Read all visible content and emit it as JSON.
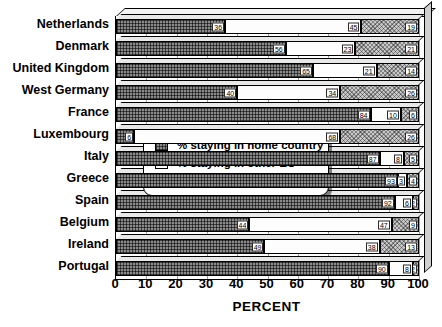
{
  "chart_data": {
    "type": "bar",
    "subtype": "stacked-horizontal-100-percent",
    "title": "",
    "xlabel": "PERCENT",
    "ylabel": "",
    "xlim": [
      0,
      100
    ],
    "xticks": [
      "0",
      "10",
      "20",
      "30",
      "40",
      "50",
      "60",
      "70",
      "80",
      "90",
      "100"
    ],
    "grid": true,
    "legend_position": "center-left-overlay",
    "categories": [
      "Netherlands",
      "Denmark",
      "United Kingdom",
      "West Germany",
      "France",
      "Luxembourg",
      "Italy",
      "Greece",
      "Spain",
      "Belgium",
      "Ireland",
      "Portugal"
    ],
    "series": [
      {
        "name": "% staying in home country",
        "values": [
          36,
          56,
          65,
          40,
          84,
          6,
          87,
          93,
          92,
          44,
          49,
          90
        ]
      },
      {
        "name": "% staying in other EC",
        "values": [
          45,
          23,
          21,
          34,
          10,
          68,
          8,
          3,
          6,
          47,
          38,
          8
        ]
      },
      {
        "name": "% staying outside EC",
        "values": [
          19,
          21,
          14,
          26,
          6,
          26,
          5,
          4,
          2,
          9,
          13,
          2
        ]
      }
    ]
  },
  "legend": {
    "items": [
      {
        "label": "% staying in home country",
        "swatch": "home"
      },
      {
        "label": "% staying in other EC",
        "swatch": "other"
      },
      {
        "label": "% staying outside EC",
        "swatch": "outside"
      }
    ]
  }
}
